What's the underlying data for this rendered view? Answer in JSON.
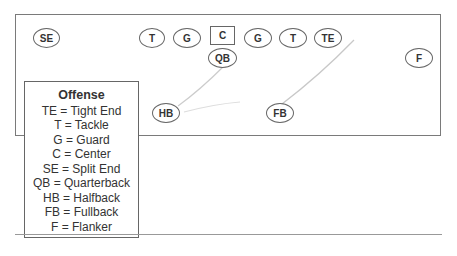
{
  "players": {
    "se": "SE",
    "lt": "T",
    "lg": "G",
    "c": "C",
    "rg": "G",
    "rt": "T",
    "te": "TE",
    "qb": "QB",
    "f": "F",
    "hb": "HB",
    "fb": "FB"
  },
  "legend": {
    "title": "Offense",
    "items": [
      "TE = Tight End",
      "T = Tackle",
      "G = Guard",
      "C = Center",
      "SE = Split End",
      "QB = Quarterback",
      "HB = Halfback",
      "FB = Fullback",
      "F = Flanker"
    ]
  }
}
